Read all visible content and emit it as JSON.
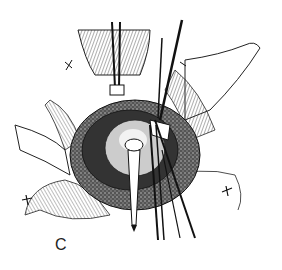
{
  "figure": {
    "panel_label": "C"
  }
}
